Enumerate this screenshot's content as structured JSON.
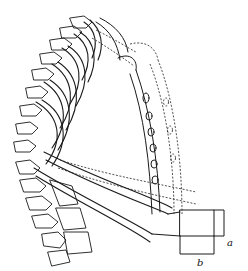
{
  "figure": {
    "style": "black line engraving on white",
    "colors": {
      "ink": "#1a1a1a",
      "background": "#ffffff"
    },
    "labels": [
      {
        "id": "a",
        "text": "a",
        "x": 227,
        "y": 246
      },
      {
        "id": "b",
        "text": "b",
        "x": 197,
        "y": 266
      }
    ]
  }
}
